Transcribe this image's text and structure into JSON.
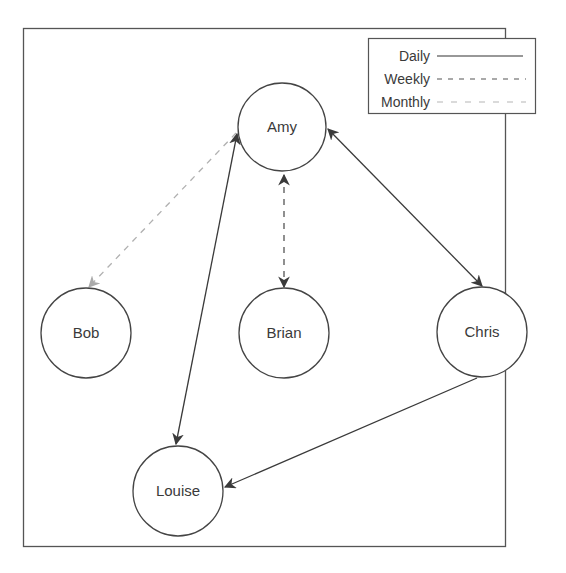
{
  "diagram": {
    "type": "directed-graph",
    "nodes": [
      {
        "id": "amy",
        "label": "Amy",
        "cx": 282,
        "cy": 127,
        "r": 44
      },
      {
        "id": "bob",
        "label": "Bob",
        "cx": 86,
        "cy": 333,
        "r": 45
      },
      {
        "id": "brian",
        "label": "Brian",
        "cx": 284,
        "cy": 333,
        "r": 45
      },
      {
        "id": "chris",
        "label": "Chris",
        "cx": 482,
        "cy": 332,
        "r": 45
      },
      {
        "id": "louise",
        "label": "Louise",
        "cx": 178,
        "cy": 491,
        "r": 45
      }
    ],
    "edges": [
      {
        "from": "amy",
        "to": "bob",
        "frequency": "Monthly",
        "direction": "to"
      },
      {
        "from": "amy",
        "to": "brian",
        "frequency": "Weekly",
        "direction": "both"
      },
      {
        "from": "amy",
        "to": "chris",
        "frequency": "Daily",
        "direction": "both"
      },
      {
        "from": "amy",
        "to": "louise",
        "frequency": "Daily",
        "direction": "both"
      },
      {
        "from": "chris",
        "to": "louise",
        "frequency": "Daily",
        "direction": "to"
      }
    ],
    "legend": {
      "items": [
        {
          "label": "Daily",
          "style": "solid",
          "color": "#333333"
        },
        {
          "label": "Weekly",
          "style": "dashed",
          "color": "#555555"
        },
        {
          "label": "Monthly",
          "style": "dashed-light",
          "color": "#b0b0b0"
        }
      ]
    },
    "colors": {
      "stroke": "#444444",
      "monthly": "#b0b0b0",
      "frame": "#555555",
      "background": "#ffffff"
    }
  }
}
